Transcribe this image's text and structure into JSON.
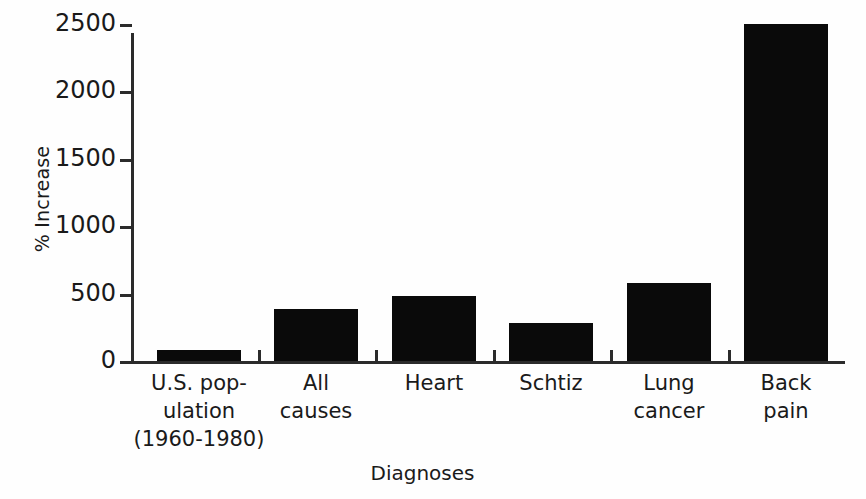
{
  "chart_data": {
    "type": "bar",
    "title": "",
    "subtitle": "",
    "xlabel": "Diagnoses",
    "ylabel": "% Increase",
    "categories": [
      "U.S. pop-ulation (1960-1980)",
      "All causes",
      "Heart",
      "Schtiz",
      "Lung cancer",
      "Back pain"
    ],
    "category_lines": [
      [
        "U.S. pop-",
        "ulation",
        "(1960-1980)"
      ],
      [
        "All",
        "causes"
      ],
      [
        "Heart"
      ],
      [
        "Schtiz"
      ],
      [
        "Lung",
        "cancer"
      ],
      [
        "Back",
        "pain"
      ]
    ],
    "values": [
      85,
      385,
      485,
      285,
      580,
      2500
    ],
    "ylim": [
      0,
      2500
    ],
    "ytick_values": [
      0,
      500,
      1000,
      1500,
      2000,
      2500
    ],
    "ytick_labels": [
      "0",
      "500",
      "1000",
      "1500",
      "2000",
      "2500"
    ],
    "grid": false,
    "legend": false,
    "legend_position": "none",
    "bar_color": "#0a0a0a",
    "axis_color": "#2b2b2b",
    "background_color": "#fefefe"
  },
  "axes": {
    "y_title": "% Increase",
    "x_title": "Diagnoses"
  },
  "ytick_labels": {
    "t0": "0",
    "t1": "500",
    "t2": "1000",
    "t3": "1500",
    "t4": "2000",
    "t5": "2500"
  },
  "xcat_labels": {
    "c0l0": "U.S. pop-",
    "c0l1": "ulation",
    "c0l2": "(1960-1980)",
    "c1l0": "All",
    "c1l1": "causes",
    "c2l0": "Heart",
    "c3l0": "Schtiz",
    "c4l0": "Lung",
    "c4l1": "cancer",
    "c5l0": "Back",
    "c5l1": "pain"
  }
}
